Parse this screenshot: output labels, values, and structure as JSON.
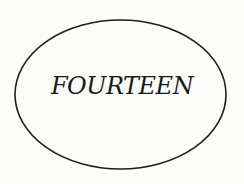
{
  "diagram": {
    "shape": "ellipse",
    "label": "FOURTEEN",
    "stroke_color": "#1e1e1e",
    "background_color": "#fdfdfc"
  }
}
